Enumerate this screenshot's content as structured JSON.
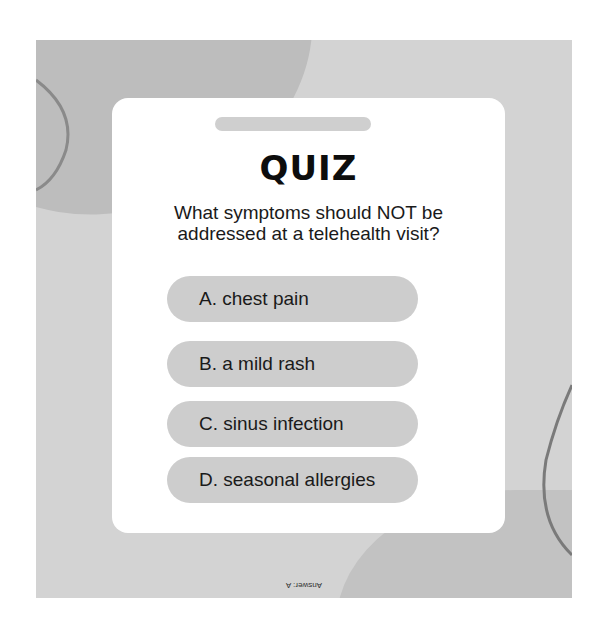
{
  "quiz": {
    "title": "QUIZ",
    "question": "What symptoms should NOT be addressed at a telehealth visit?",
    "options": [
      {
        "label": "A. chest pain"
      },
      {
        "label": "B. a mild rash"
      },
      {
        "label": "C. sinus infection"
      },
      {
        "label": "D. seasonal allergies"
      }
    ],
    "answer": "Answer: A"
  },
  "colors": {
    "panel_background": "#d3d3d3",
    "card_background": "#ffffff",
    "option_background": "#cdcdcd",
    "title_color": "#0d0d0d"
  }
}
